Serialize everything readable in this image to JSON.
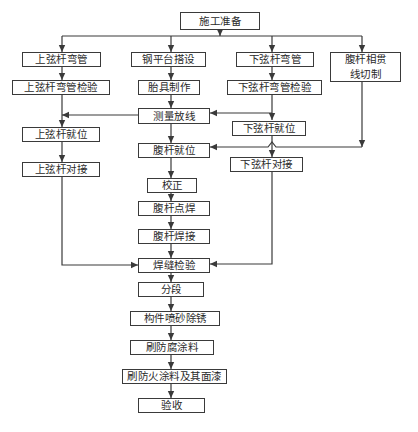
{
  "diagram": {
    "type": "flowchart",
    "colors": {
      "stroke": "#3a3a3a",
      "text": "#2a2a2a",
      "background": "#ffffff"
    },
    "nodes": {
      "start": "施工准备",
      "upper_chord_bending": "上弦杆弯管",
      "upper_chord_bending_inspection": "上弦杆弯管检验",
      "upper_chord_positioning": "上弦杆就位",
      "upper_chord_butt_joint": "上弦杆对接",
      "steel_platform_setup": "钢平台搭设",
      "jig_fabrication": "胎具制作",
      "survey_layout": "测量放线",
      "web_member_positioning": "腹杆就位",
      "correction": "校正",
      "web_member_spot_welding": "腹杆点焊",
      "web_member_welding": "腹杆焊接",
      "weld_inspection": "焊缝检验",
      "segmentation": "分段",
      "sandblasting_derusting": "构件喷砂除锈",
      "anticorrosive_coating": "刷防腐涂料",
      "fireproof_coating_topcoat": "刷防火涂料及其面漆",
      "acceptance": "验收",
      "lower_chord_bending": "下弦杆弯管",
      "lower_chord_bending_inspection": "下弦杆弯管检验",
      "lower_chord_positioning": "下弦杆就位",
      "lower_chord_butt_joint": "下弦杆对接",
      "web_intersection_cutting": "腹杆相贯\n线切制"
    },
    "edges": [
      [
        "施工准备",
        "上弦杆弯管"
      ],
      [
        "施工准备",
        "钢平台搭设"
      ],
      [
        "施工准备",
        "下弦杆弯管"
      ],
      [
        "施工准备",
        "腹杆相贯线切制"
      ],
      [
        "上弦杆弯管",
        "上弦杆弯管检验"
      ],
      [
        "上弦杆弯管检验",
        "上弦杆就位"
      ],
      [
        "测量放线",
        "上弦杆就位"
      ],
      [
        "上弦杆就位",
        "上弦杆对接"
      ],
      [
        "上弦杆对接",
        "焊缝检验"
      ],
      [
        "钢平台搭设",
        "胎具制作"
      ],
      [
        "胎具制作",
        "测量放线"
      ],
      [
        "测量放线",
        "腹杆就位"
      ],
      [
        "下弦杆弯管",
        "下弦杆弯管检验"
      ],
      [
        "下弦杆弯管检验",
        "测量放线"
      ],
      [
        "下弦杆弯管检验",
        "下弦杆就位"
      ],
      [
        "下弦杆就位",
        "下弦杆对接"
      ],
      [
        "下弦杆对接",
        "焊缝检验"
      ],
      [
        "腹杆相贯线切制",
        "腹杆就位"
      ],
      [
        "腹杆就位",
        "校正"
      ],
      [
        "校正",
        "腹杆点焊"
      ],
      [
        "腹杆点焊",
        "腹杆焊接"
      ],
      [
        "腹杆焊接",
        "焊缝检验"
      ],
      [
        "焊缝检验",
        "分段"
      ],
      [
        "分段",
        "构件喷砂除锈"
      ],
      [
        "构件喷砂除锈",
        "刷防腐涂料"
      ],
      [
        "刷防腐涂料",
        "刷防火涂料及其面漆"
      ],
      [
        "刷防火涂料及其面漆",
        "验收"
      ]
    ]
  }
}
